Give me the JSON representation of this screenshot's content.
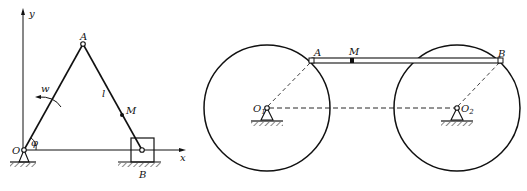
{
  "figure_left": {
    "title": "crank-slider mechanism",
    "labels": {
      "y_axis": "y",
      "x_axis": "x",
      "origin": "O",
      "point_a": "A",
      "point_b": "B",
      "point_m": "M",
      "link_length": "l",
      "angular_velocity": "w",
      "angle": "φ"
    }
  },
  "figure_right": {
    "title": "two-wheel coupler mechanism",
    "labels": {
      "point_a": "A",
      "point_b": "B",
      "point_m": "M",
      "center_1": "O",
      "center_1_sub": "1",
      "center_2": "O",
      "center_2_sub": "2"
    }
  },
  "colors": {
    "stroke": "#111111",
    "background": "#ffffff"
  }
}
